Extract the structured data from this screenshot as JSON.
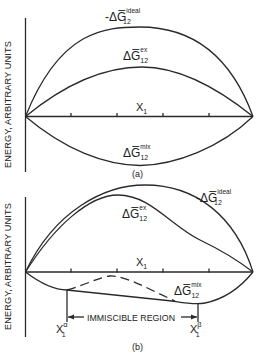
{
  "panel_a": {
    "y_axis_label": "ENERGY, ARBITRARY UNITS",
    "x_axis_label": "X",
    "x_axis_sub": "1",
    "caption": "(a)",
    "curves": {
      "ideal": {
        "prefix": "-Δ",
        "symbol": "G̅",
        "sub": "12",
        "sup": "ideal"
      },
      "excess": {
        "prefix": "Δ",
        "symbol": "G̅",
        "sub": "12",
        "sup": "ex"
      },
      "mix": {
        "prefix": "Δ",
        "symbol": "G̅",
        "sub": "12",
        "sup": "mix"
      }
    }
  },
  "panel_b": {
    "y_axis_label": "ENERGY, ARBITRARY UNITS",
    "x_axis_label": "X",
    "x_axis_sub": "1",
    "caption": "(b)",
    "curves": {
      "ideal": {
        "prefix": "-Δ",
        "symbol": "G̅",
        "sub": "12",
        "sup": "ideal"
      },
      "excess": {
        "prefix": "Δ",
        "symbol": "G̅",
        "sub": "12",
        "sup": "ex"
      },
      "mix": {
        "prefix": "Δ",
        "symbol": "G̅",
        "sub": "12",
        "sup": "mix"
      }
    },
    "region_label": "IMMISCIBLE REGION",
    "alpha_marker": {
      "symbol": "X",
      "sub": "1",
      "sup": "α"
    },
    "beta_marker": {
      "symbol": "X",
      "sub": "1",
      "sup": "β"
    }
  }
}
